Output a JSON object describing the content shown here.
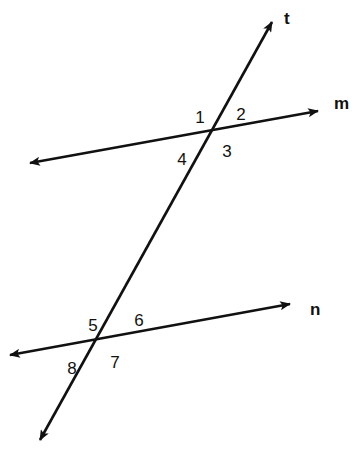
{
  "figure": {
    "background_color": "#ffffff",
    "stroke_color": "#111111",
    "canvas": {
      "width": 357,
      "height": 452
    }
  },
  "lines": [
    {
      "id": "t",
      "label": "t",
      "role": "transversal",
      "label_position": {
        "x": 284,
        "y": 20
      },
      "start": {
        "x": 40,
        "y": 440
      },
      "end": {
        "x": 272,
        "y": 22
      },
      "arrow_start": true,
      "arrow_end": true
    },
    {
      "id": "m",
      "label": "m",
      "role": "parallel-line-upper",
      "label_position": {
        "x": 334,
        "y": 105
      },
      "start": {
        "x": 30,
        "y": 163
      },
      "end": {
        "x": 318,
        "y": 111
      },
      "arrow_start": true,
      "arrow_end": true
    },
    {
      "id": "n",
      "label": "n",
      "role": "parallel-line-lower",
      "label_position": {
        "x": 310,
        "y": 311
      },
      "start": {
        "x": 10,
        "y": 355
      },
      "end": {
        "x": 290,
        "y": 304
      },
      "arrow_start": true,
      "arrow_end": true
    }
  ],
  "intersections": [
    {
      "id": "upper",
      "lines": [
        "t",
        "m"
      ],
      "x": 209,
      "y": 128
    },
    {
      "id": "lower",
      "lines": [
        "t",
        "n"
      ],
      "x": 100,
      "y": 337
    }
  ],
  "angle_labels": [
    {
      "id": "angle-1",
      "text": "1",
      "x": 200,
      "y": 119,
      "intersection": "upper",
      "quadrant": "upper-left"
    },
    {
      "id": "angle-2",
      "text": "2",
      "x": 241,
      "y": 116,
      "intersection": "upper",
      "quadrant": "upper-right"
    },
    {
      "id": "angle-3",
      "text": "3",
      "x": 227,
      "y": 153,
      "intersection": "upper",
      "quadrant": "lower-right"
    },
    {
      "id": "angle-4",
      "text": "4",
      "x": 182,
      "y": 161,
      "intersection": "upper",
      "quadrant": "lower-left"
    },
    {
      "id": "angle-5",
      "text": "5",
      "x": 93,
      "y": 327,
      "intersection": "lower",
      "quadrant": "upper-left"
    },
    {
      "id": "angle-6",
      "text": "6",
      "x": 139,
      "y": 322,
      "intersection": "lower",
      "quadrant": "upper-right"
    },
    {
      "id": "angle-7",
      "text": "7",
      "x": 115,
      "y": 364,
      "intersection": "lower",
      "quadrant": "lower-right"
    },
    {
      "id": "angle-8",
      "text": "8",
      "x": 72,
      "y": 370,
      "intersection": "lower",
      "quadrant": "lower-left"
    }
  ]
}
